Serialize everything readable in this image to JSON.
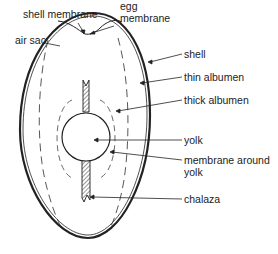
{
  "diagram": {
    "labels": {
      "shell_membrane": "shell membrane",
      "egg_membrane_1": "egg",
      "egg_membrane_2": "membrane",
      "air_sac": "air sac",
      "shell": "shell",
      "thin_albumen": "thin albumen",
      "thick_albumen": "thick albumen",
      "yolk": "yolk",
      "membrane_around_yolk_1": "membrane around",
      "membrane_around_yolk_2": "yolk",
      "chalaza": "chalaza"
    },
    "colors": {
      "line": "#222222",
      "background": "#ffffff"
    }
  }
}
